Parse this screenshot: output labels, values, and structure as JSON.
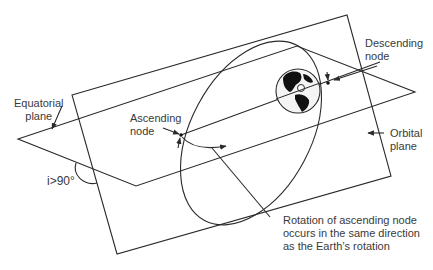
{
  "diagram": {
    "labels": {
      "equatorial_plane": [
        "Equatorial",
        "plane"
      ],
      "ascending_node": [
        "Ascending",
        "node"
      ],
      "descending_node": [
        "Descending",
        "node"
      ],
      "orbital_plane": [
        "Orbital",
        "plane"
      ],
      "inclination": "i>90°",
      "rotation_note": [
        "Rotation of ascending node",
        "occurs in the same direction",
        "as the Earth’s rotation"
      ]
    },
    "colors": {
      "line": "#2a2a2a",
      "text": "#3a3a3a",
      "background": "#ffffff"
    },
    "icons": {
      "earth": "earth-globe-icon"
    }
  }
}
